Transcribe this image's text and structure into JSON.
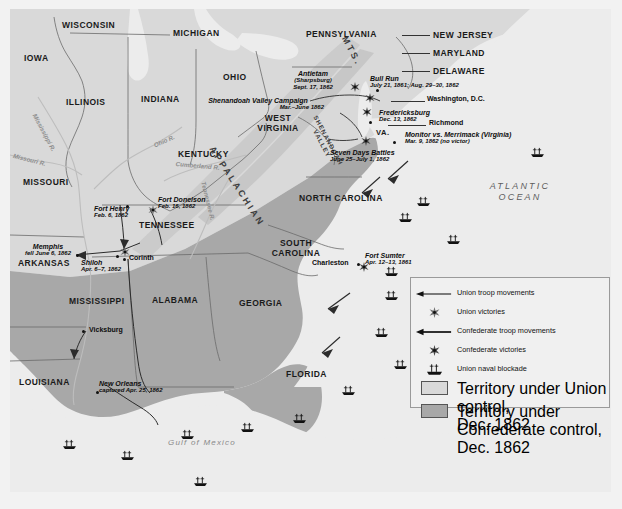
{
  "map": {
    "title": "Civil War in the East and South, 1861-1862",
    "colors": {
      "union_territory": "#d9d9d9",
      "confederate_territory": "#a8a8a8",
      "water": "#ececec",
      "border": "#6b6b6b",
      "marker": "#111111"
    },
    "states": [
      {
        "name": "WISCONSIN",
        "x": 52,
        "y": 12,
        "cls": "state"
      },
      {
        "name": "MICHIGAN",
        "x": 163,
        "y": 20,
        "cls": "state"
      },
      {
        "name": "IOWA",
        "x": 14,
        "y": 45,
        "cls": "state"
      },
      {
        "name": "ILLINOIS",
        "x": 56,
        "y": 89,
        "cls": "state"
      },
      {
        "name": "INDIANA",
        "x": 131,
        "y": 86,
        "cls": "state"
      },
      {
        "name": "OHIO",
        "x": 213,
        "y": 64,
        "cls": "state"
      },
      {
        "name": "PENNSYLVANIA",
        "x": 296,
        "y": 21,
        "cls": "state"
      },
      {
        "name": "NEW JERSEY",
        "x": 423,
        "y": 22,
        "cls": "state"
      },
      {
        "name": "MARYLAND",
        "x": 423,
        "y": 40,
        "cls": "state"
      },
      {
        "name": "DELAWARE",
        "x": 423,
        "y": 58,
        "cls": "state"
      },
      {
        "name": "MISSOURI",
        "x": 13,
        "y": 169,
        "cls": "state"
      },
      {
        "name": "KENTUCKY",
        "x": 168,
        "y": 141,
        "cls": "state"
      },
      {
        "name": "TENNESSEE",
        "x": 129,
        "y": 212,
        "cls": "state"
      },
      {
        "name": "ARKANSAS",
        "x": 8,
        "y": 250,
        "cls": "state"
      },
      {
        "name": "MISSISSIPPI",
        "x": 59,
        "y": 288,
        "cls": "state"
      },
      {
        "name": "ALABAMA",
        "x": 142,
        "y": 287,
        "cls": "state"
      },
      {
        "name": "GEORGIA",
        "x": 229,
        "y": 290,
        "cls": "state"
      },
      {
        "name": "LOUISIANA",
        "x": 9,
        "y": 369,
        "cls": "state"
      },
      {
        "name": "FLORIDA",
        "x": 276,
        "y": 361,
        "cls": "state"
      },
      {
        "name": "VA.",
        "x": 366,
        "y": 120,
        "cls": "state sm"
      }
    ],
    "states_multiline": [
      {
        "line1": "WEST",
        "line2": "VIRGINIA",
        "x": 252,
        "y": 110
      },
      {
        "line1": "NORTH",
        "line2": "CAROLINA",
        "x": 292,
        "y": 185,
        "inline": true
      },
      {
        "line1": "SOUTH",
        "line2": "CAROLINA",
        "x": 266,
        "y": 234
      }
    ],
    "ranges": [
      {
        "name": "APPALACHIAN",
        "x": 212,
        "y": 138,
        "rotate": 57,
        "cls": "rng"
      },
      {
        "name": "MTS.",
        "x": 338,
        "y": 30,
        "rotate": 62,
        "cls": "rng"
      },
      {
        "name": "SHENANDOAH",
        "line2": "VALLEY",
        "x": 312,
        "y": 110,
        "rotate": 62,
        "cls": "rng sm"
      }
    ],
    "rivers": [
      {
        "name": "Mississippi R.",
        "x": 30,
        "y": 110,
        "rotate": 62
      },
      {
        "name": "Missouri R.",
        "x": 7,
        "y": 147,
        "rotate": 14
      },
      {
        "name": "Ohio R.",
        "x": 148,
        "y": 130,
        "rotate": -22
      },
      {
        "name": "Cumberland R.",
        "x": 168,
        "y": 155,
        "rotate": 6
      },
      {
        "name": "Tennessee R.",
        "x": 193,
        "y": 176,
        "rotate": 74
      }
    ],
    "waters": [
      {
        "name": "ATLANTIC",
        "line2": "OCEAN",
        "x": 478,
        "y": 175,
        "cls": "ocean"
      },
      {
        "name": "Gulf of Mexico",
        "x": 160,
        "y": 432,
        "cls": "gulf"
      }
    ],
    "cities": [
      {
        "name": "Washington, D.C.",
        "x": 420,
        "y": 89,
        "dotx": 368,
        "doty": 81,
        "lead": {
          "x": 384,
          "y": 92,
          "w": 34
        }
      },
      {
        "name": "Richmond",
        "x": 419,
        "y": 112,
        "dotx": 360,
        "doty": 113,
        "lead": {
          "x": 380,
          "y": 116,
          "w": 36
        }
      },
      {
        "name": "Charleston",
        "x": 310,
        "y": 254,
        "dotx": 349,
        "doty": 255,
        "labelRight": false
      },
      {
        "name": "Vicksburg",
        "x": 81,
        "y": 320,
        "dotx": 74,
        "doty": 322,
        "labelRight": true
      },
      {
        "name": "Corinth",
        "x": 120,
        "y": 253,
        "dotx": 114,
        "doty": 250,
        "labelRight": true
      }
    ],
    "battles": [
      {
        "name": "Antietam",
        "line2": "(Sharpsburg)",
        "date": "Sept. 17, 1862",
        "x": 286,
        "y": 63,
        "align": "center",
        "star": {
          "x": 340,
          "y": 73,
          "side": "confederate"
        }
      },
      {
        "name": "Bull Run",
        "date": "July 21, 1861; Aug. 29–30, 1862",
        "x": 359,
        "y": 68,
        "align": "left",
        "star": {
          "x": 358,
          "y": 88,
          "side": "confederate"
        }
      },
      {
        "name": "Fredericksburg",
        "date": "Dec. 13, 1862",
        "x": 370,
        "y": 102,
        "align": "left",
        "star": {
          "x": 355,
          "y": 100,
          "side": "confederate"
        }
      },
      {
        "name": "Monitor vs. Merrimack (Virginia)",
        "date": "Mar. 9, 1862 (no victor)",
        "x": 406,
        "y": 123,
        "align": "left",
        "star": null
      },
      {
        "name": "Seven Days Battles",
        "date": "June 25–July 1, 1862",
        "x": 325,
        "y": 140,
        "align": "left",
        "star": {
          "x": 354,
          "y": 129,
          "side": "confederate"
        }
      },
      {
        "name": "Shenandoah Valley Campaign",
        "date": "Mar.–June 1862",
        "x": 202,
        "y": 90,
        "align": "center",
        "star": null
      },
      {
        "name": "Fort Donelson",
        "date": "Feb. 16, 1862",
        "x": 149,
        "y": 189,
        "align": "left",
        "star": {
          "x": 140,
          "y": 199,
          "side": "union"
        }
      },
      {
        "name": "Fort Henry",
        "date": "Feb. 6, 1862",
        "x": 88,
        "y": 196,
        "align": "left",
        "star": null
      },
      {
        "name": "Memphis",
        "line2": "fell June 6, 1862",
        "x": 13,
        "y": 235,
        "align": "left",
        "star": null
      },
      {
        "name": "Shiloh",
        "date": "Apr. 6–7, 1862",
        "x": 73,
        "y": 251,
        "align": "left",
        "star": {
          "x": 113,
          "y": 240,
          "side": "union"
        }
      },
      {
        "name": "New Orleans",
        "line2": "captured Apr. 25, 1862",
        "x": 90,
        "y": 373,
        "align": "left",
        "star": null
      },
      {
        "name": "Fort Sumter",
        "date": "Apr. 12–13, 1861",
        "x": 355,
        "y": 245,
        "align": "left",
        "star": {
          "x": 352,
          "y": 256,
          "side": "confederate"
        }
      }
    ],
    "ships": [
      {
        "x": 388,
        "y": 203
      },
      {
        "x": 436,
        "y": 225
      },
      {
        "x": 406,
        "y": 187
      },
      {
        "x": 374,
        "y": 257
      },
      {
        "x": 374,
        "y": 281
      },
      {
        "x": 364,
        "y": 318
      },
      {
        "x": 383,
        "y": 350
      },
      {
        "x": 331,
        "y": 376
      },
      {
        "x": 230,
        "y": 413
      },
      {
        "x": 170,
        "y": 420
      },
      {
        "x": 282,
        "y": 404
      },
      {
        "x": 110,
        "y": 441
      },
      {
        "x": 52,
        "y": 430
      },
      {
        "x": 183,
        "y": 467
      },
      {
        "x": 520,
        "y": 138
      }
    ]
  },
  "legend": {
    "title": "Map Legend",
    "rows": [
      {
        "symbol": "union-arrow",
        "label": "Union troop movements"
      },
      {
        "symbol": "union-star",
        "label": "Union victories"
      },
      {
        "symbol": "confederate-arrow",
        "label": "Confederate troop movements"
      },
      {
        "symbol": "confederate-star",
        "label": "Confederate victories"
      },
      {
        "symbol": "naval-blockade",
        "label": "Union naval blockade"
      }
    ],
    "swatches": [
      {
        "symbol": "union-territory-swatch",
        "line1": "Territory under Union control,",
        "line2": "Dec. 1862",
        "color": "#d9d9d9"
      },
      {
        "symbol": "confederate-territory-swatch",
        "line1": "Territory under Confederate control,",
        "line2": "Dec. 1862",
        "color": "#a8a8a8"
      }
    ]
  }
}
